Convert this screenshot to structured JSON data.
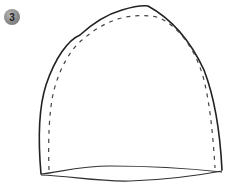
{
  "step": {
    "number": "3",
    "badge_color": "#8a8a8a"
  },
  "diagram": {
    "outline_style": "solid",
    "seam_allowance_style": "dashed",
    "stroke_color": "#222222",
    "dash_color": "#444444"
  }
}
